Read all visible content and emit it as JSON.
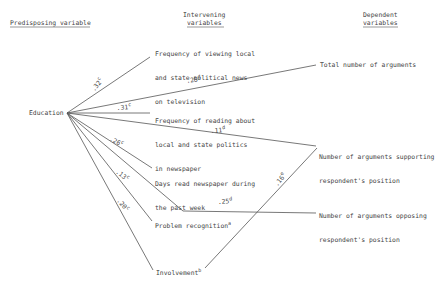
{
  "headers": {
    "predisposing": "Predisposing variable",
    "intervening_line1": "Intervening",
    "intervening_line2": "variables",
    "dependent_line1": "Dependent",
    "dependent_line2": "variables"
  },
  "nodes": {
    "education": "Education",
    "tv_news_1": "Frequency of viewing local",
    "tv_news_2": "and state political news",
    "tv_news_3": "on television",
    "reading_1": "Frequency of reading about",
    "reading_2": "local and state politics",
    "reading_3": "in newspaper",
    "days_read_1": "Days read newspaper during",
    "days_read_2": "the past week",
    "problem_recognition": "Problem recognition",
    "problem_recognition_sup": "a",
    "involvement": "Involvement",
    "involvement_sup": "b",
    "total_args": "Total number of arguments",
    "supporting_1": "Number of arguments supporting",
    "supporting_2": "respondent's position",
    "opposing_1": "Number of arguments opposing",
    "opposing_2": "respondent's position"
  },
  "coefficients": [
    {
      "from": "Education",
      "to": "Frequency of viewing local and state political news on television",
      "value": ".32",
      "sup": "c"
    },
    {
      "from": "Frequency of viewing local and state political news on television",
      "to": "Total number of arguments",
      "value": ".25",
      "sup": "d"
    },
    {
      "from": "Education",
      "to": "Frequency of reading about local and state politics in newspaper",
      "value": ".31",
      "sup": "c"
    },
    {
      "from": "Education",
      "to": "Number of arguments supporting respondent's position",
      "value": ".11",
      "sup": "d"
    },
    {
      "from": "Education",
      "to": "Days read newspaper during the past week",
      "value": ".26",
      "sup": "c"
    },
    {
      "from": "Education",
      "to": "Problem recognition",
      "value": ".13",
      "sup": "c"
    },
    {
      "from": "Education",
      "to": "Involvement",
      "value": ".20",
      "sup": "c"
    },
    {
      "from": "Days read newspaper during the past week",
      "to": "Number of arguments opposing respondent's position",
      "value": ".25",
      "sup": "d"
    },
    {
      "from": "Involvement",
      "to": "Number of arguments supporting respondent's position",
      "value": ".16",
      "sup": "e"
    }
  ]
}
